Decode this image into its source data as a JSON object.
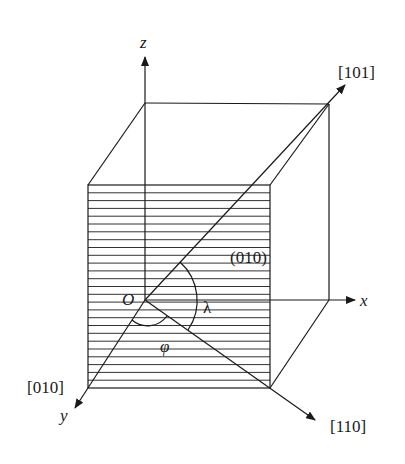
{
  "figure": {
    "type": "crystal-cube-slip-geometry",
    "axes": {
      "z": "z",
      "x": "x",
      "y": "y"
    },
    "origin_label": "O",
    "plane_label": "(010)",
    "directions": {
      "d101": "[101]",
      "d010": "[010]",
      "d110": "[110]"
    },
    "angles": {
      "lambda": "λ",
      "phi": "φ"
    },
    "colors": {
      "line": "#1a1a1a",
      "background": "#ffffff"
    },
    "hatch_line_count": 26
  }
}
